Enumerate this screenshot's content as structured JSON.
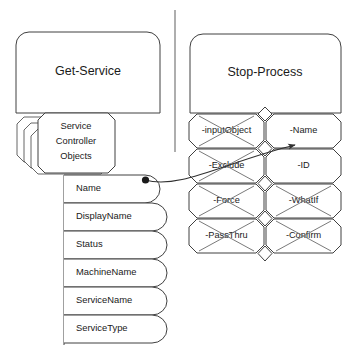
{
  "diagram": {
    "left_cmdlet": {
      "title": "Get-Service",
      "output_stack": {
        "line1": "Service",
        "line2": "Controller",
        "line3": "Objects"
      },
      "properties": [
        {
          "label": "Name"
        },
        {
          "label": "DisplayName"
        },
        {
          "label": "Status"
        },
        {
          "label": "MachineName"
        },
        {
          "label": "ServiceName"
        },
        {
          "label": "ServiceType"
        }
      ]
    },
    "right_cmdlet": {
      "title": "Stop-Process",
      "parameters": [
        {
          "label": "-inputObject",
          "crossed": true
        },
        {
          "label": "-Name",
          "crossed": false
        },
        {
          "label": "-Exclude",
          "crossed": true
        },
        {
          "label": "-ID",
          "crossed": false
        },
        {
          "label": "-Force",
          "crossed": true
        },
        {
          "label": "-WhatIf",
          "crossed": true
        },
        {
          "label": "-PassThru",
          "crossed": true
        },
        {
          "label": "-Confirm",
          "crossed": true
        }
      ]
    },
    "connector": {
      "from": "Name",
      "to": "-Name",
      "start_marker": "filled-dot",
      "end_marker": "arrowhead"
    },
    "colors": {
      "stroke": "#404040",
      "cross": "#7a7a7a",
      "divider": "#9a9a9a",
      "connector": "#303030",
      "background": "#ffffff",
      "text": "#1a1a1a"
    }
  }
}
